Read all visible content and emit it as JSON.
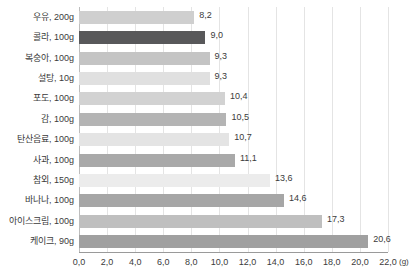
{
  "chart_data": {
    "type": "bar",
    "orientation": "horizontal",
    "title": "",
    "xlabel": "(g)",
    "ylabel": "",
    "xlim": [
      0,
      22
    ],
    "xticks": [
      "0,0",
      "2,0",
      "4,0",
      "6,0",
      "8,0",
      "10,0",
      "12,0",
      "14,0",
      "16,0",
      "18,0",
      "20,0",
      "22,0"
    ],
    "xtick_values": [
      0,
      2,
      4,
      6,
      8,
      10,
      12,
      14,
      16,
      18,
      20,
      22
    ],
    "grid": true,
    "legend": "none",
    "decimal_separator": ",",
    "unit": "(g)",
    "categories": [
      "우유, 200g",
      "콜라, 100g",
      "복숭아, 100g",
      "설탕, 10g",
      "포도, 100g",
      "감, 100g",
      "탄산음료, 100g",
      "사과, 100g",
      "참외, 150g",
      "바나나, 100g",
      "아이스크림, 100g",
      "케이크, 90g"
    ],
    "values": [
      8.2,
      9.0,
      9.3,
      9.3,
      10.4,
      10.5,
      10.7,
      11.1,
      13.6,
      14.6,
      17.3,
      20.6
    ],
    "value_labels": [
      "8,2",
      "9,0",
      "9,3",
      "9,3",
      "10,4",
      "10,5",
      "10,7",
      "11,1",
      "13,6",
      "14,6",
      "17,3",
      "20,6"
    ],
    "bar_colors": [
      "#cfcfcf",
      "#58585a",
      "#c4c4c4",
      "#e0e0e0",
      "#d2d2d2",
      "#b4b4b4",
      "#e4e4e4",
      "#a9a9a9",
      "#ececec",
      "#a6a6a6",
      "#bfbfbf",
      "#a0a0a0"
    ],
    "grid_color": "#e4e4e4",
    "axis_color": "#9a9a9a",
    "text_color": "#3b3b3b"
  }
}
